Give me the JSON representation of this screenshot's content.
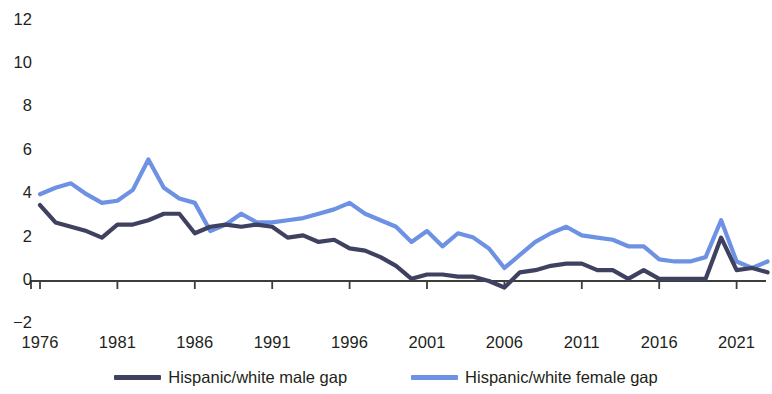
{
  "chart_data": {
    "type": "line",
    "title": "",
    "subtitle": "",
    "xlabel": "",
    "ylabel": "",
    "grid": false,
    "legend_position": "bottom",
    "xlim": [
      1976,
      2023
    ],
    "ylim": [
      -2,
      12
    ],
    "yticks": [
      12,
      10,
      8,
      6,
      4,
      2,
      0,
      -2
    ],
    "xticks": [
      1976,
      1981,
      1986,
      1991,
      1996,
      2001,
      2006,
      2011,
      2016,
      2021
    ],
    "x": [
      1976,
      1977,
      1978,
      1979,
      1980,
      1981,
      1982,
      1983,
      1984,
      1985,
      1986,
      1987,
      1988,
      1989,
      1990,
      1991,
      1992,
      1993,
      1994,
      1995,
      1996,
      1997,
      1998,
      1999,
      2000,
      2001,
      2002,
      2003,
      2004,
      2005,
      2006,
      2007,
      2008,
      2009,
      2010,
      2011,
      2012,
      2013,
      2014,
      2015,
      2016,
      2017,
      2018,
      2019,
      2020,
      2021,
      2022,
      2023
    ],
    "series": [
      {
        "name": "Hispanic/white male gap",
        "color": "#3f4161",
        "values": [
          3.5,
          2.7,
          2.5,
          2.3,
          2.0,
          2.6,
          2.6,
          2.8,
          3.1,
          3.1,
          2.2,
          2.5,
          2.6,
          2.5,
          2.6,
          2.5,
          2.0,
          2.1,
          1.8,
          1.9,
          1.5,
          1.4,
          1.1,
          0.7,
          0.1,
          0.3,
          0.3,
          0.2,
          0.2,
          0.0,
          -0.3,
          0.4,
          0.5,
          0.7,
          0.8,
          0.8,
          0.5,
          0.5,
          0.1,
          0.5,
          0.1,
          0.1,
          0.1,
          0.1,
          2.0,
          0.5,
          0.6,
          0.4
        ]
      },
      {
        "name": "Hispanic/white female gap",
        "color": "#6e92e3",
        "values": [
          4.0,
          4.3,
          4.5,
          4.0,
          3.6,
          3.7,
          4.2,
          5.6,
          4.3,
          3.8,
          3.6,
          2.3,
          2.6,
          3.1,
          2.7,
          2.7,
          2.8,
          2.9,
          3.1,
          3.3,
          3.6,
          3.1,
          2.8,
          2.5,
          1.8,
          2.3,
          1.6,
          2.2,
          2.0,
          1.5,
          0.6,
          1.2,
          1.8,
          2.2,
          2.5,
          2.1,
          2.0,
          1.9,
          1.6,
          1.6,
          1.0,
          0.9,
          0.9,
          1.1,
          2.8,
          0.9,
          0.6,
          0.9
        ]
      }
    ]
  },
  "legend": {
    "entries": [
      {
        "label": "Hispanic/white male gap",
        "color": "#3f4161"
      },
      {
        "label": "Hispanic/white female gap",
        "color": "#6e92e3"
      }
    ]
  },
  "axis": {
    "y_labels": [
      "12",
      "10",
      "8",
      "6",
      "4",
      "2",
      "0",
      "−2"
    ],
    "x_labels": [
      "1976",
      "1981",
      "1986",
      "1991",
      "1996",
      "2001",
      "2006",
      "2011",
      "2016",
      "2021"
    ]
  }
}
